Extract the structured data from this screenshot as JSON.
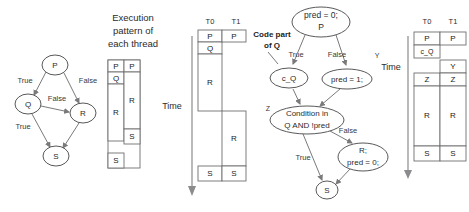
{
  "figure": {
    "colors": {
      "stroke": "#59595b",
      "edge": "#7a7a7c",
      "text": "#2b2b2b",
      "background": "#ffffff"
    }
  },
  "panel_left": {
    "name": "original-control-flow-graph",
    "nodes": [
      {
        "id": "P",
        "label": "P",
        "cx": 55,
        "cy": 65,
        "rx": 13,
        "ry": 10
      },
      {
        "id": "Q",
        "label": "Q",
        "cx": 28,
        "cy": 104,
        "rx": 13,
        "ry": 10
      },
      {
        "id": "R",
        "label": "R",
        "cx": 83,
        "cy": 113,
        "rx": 13,
        "ry": 10
      },
      {
        "id": "S",
        "label": "S",
        "cx": 56,
        "cy": 156,
        "rx": 13,
        "ry": 10
      }
    ],
    "edges": [
      {
        "from": "P",
        "to": "Q",
        "label": "True",
        "lx": 25,
        "ly": 81
      },
      {
        "from": "P",
        "to": "R",
        "label": "False",
        "lx": 88,
        "ly": 81
      },
      {
        "from": "Q",
        "to": "R",
        "label": "False",
        "lx": 57,
        "ly": 99
      },
      {
        "from": "Q",
        "to": "S",
        "label": "True",
        "lx": 23,
        "ly": 127
      },
      {
        "from": "R",
        "to": "S",
        "label": "",
        "lx": 0,
        "ly": 0
      }
    ]
  },
  "caption": {
    "name": "execution-pattern-caption",
    "lines": [
      "Execution",
      "pattern of",
      "each thread"
    ]
  },
  "table_middle": {
    "name": "execution-pattern-table",
    "columns": [
      "T0",
      "T1"
    ],
    "show_headers": false,
    "cells": [
      {
        "col": 0,
        "label": "P",
        "top": 0,
        "height": 12
      },
      {
        "col": 0,
        "label": "Q",
        "top": 12,
        "height": 12
      },
      {
        "col": 0,
        "label": "R",
        "top": 24,
        "height": 57
      },
      {
        "col": 0,
        "label": "S",
        "top": 93,
        "height": 14
      },
      {
        "col": 1,
        "label": "P",
        "top": 0,
        "height": 12
      },
      {
        "col": 1,
        "label": "R",
        "top": 12,
        "height": 57
      },
      {
        "col": 1,
        "label": "S",
        "top": 69,
        "height": 14
      }
    ]
  },
  "timeline_middle": {
    "name": "time-axis-middle",
    "label": "Time"
  },
  "table_middle_right": {
    "name": "interleaved-schedule-table",
    "columns": [
      "T0",
      "T1"
    ],
    "show_headers": true,
    "cells": [
      {
        "col": 0,
        "label": "P",
        "top": 0,
        "height": 12
      },
      {
        "col": 0,
        "label": "Q",
        "top": 12,
        "height": 12
      },
      {
        "col": 0,
        "label": "R",
        "top": 24,
        "height": 57
      },
      {
        "col": 0,
        "label": "S",
        "top": 136,
        "height": 14
      },
      {
        "col": 1,
        "label": "P",
        "top": 0,
        "height": 12
      },
      {
        "col": 1,
        "label": "R",
        "top": 81,
        "height": 55
      },
      {
        "col": 1,
        "label": "S",
        "top": 136,
        "height": 14
      }
    ]
  },
  "panel_right_graph": {
    "name": "predicated-control-flow-graph",
    "annotation": {
      "lines": [
        "Code part",
        "of Q"
      ],
      "x": 272,
      "y": 38
    },
    "nodes": [
      {
        "id": "P",
        "lines": [
          "pred = 0;",
          "P"
        ],
        "cx": 321,
        "cy": 22,
        "rx": 29,
        "ry": 15
      },
      {
        "id": "c_Q",
        "lines": [
          "c_Q"
        ],
        "cx": 289,
        "cy": 78,
        "rx": 19,
        "ry": 10
      },
      {
        "id": "pred1",
        "lines": [
          "pred = 1;"
        ],
        "cx": 347,
        "cy": 79,
        "rx": 25,
        "ry": 10
      },
      {
        "id": "cond",
        "lines": [
          "Condition in",
          "Q  AND !pred"
        ],
        "cx": 307,
        "cy": 120,
        "rx": 36,
        "ry": 14
      },
      {
        "id": "R",
        "lines": [
          "R;",
          "pred = 0;"
        ],
        "cx": 363,
        "cy": 157,
        "rx": 25,
        "ry": 14
      },
      {
        "id": "S",
        "lines": [
          "S"
        ],
        "cx": 327,
        "cy": 190,
        "rx": 11,
        "ry": 9
      }
    ],
    "edge_labels": [
      {
        "text": "True",
        "x": 296,
        "y": 55
      },
      {
        "text": "False",
        "x": 337,
        "y": 55
      },
      {
        "text": "Y",
        "x": 377,
        "y": 56
      },
      {
        "text": "Z",
        "x": 269,
        "y": 109
      },
      {
        "text": "False",
        "x": 345,
        "y": 130
      },
      {
        "text": "True",
        "x": 303,
        "y": 158
      }
    ]
  },
  "timeline_right": {
    "name": "time-axis-right",
    "label": "Time"
  },
  "table_right": {
    "name": "predicated-schedule-table",
    "columns": [
      "T0",
      "T1"
    ],
    "show_headers": true,
    "cells": [
      {
        "col": 0,
        "label": "P",
        "top": 0,
        "height": 13
      },
      {
        "col": 0,
        "label": "c_Q",
        "top": 13,
        "height": 13
      },
      {
        "col": 0,
        "label": "Z",
        "top": 41,
        "height": 13
      },
      {
        "col": 0,
        "label": "R",
        "top": 54,
        "height": 60
      },
      {
        "col": 0,
        "label": "S",
        "top": 114,
        "height": 14
      },
      {
        "col": 1,
        "label": "P",
        "top": 0,
        "height": 13
      },
      {
        "col": 1,
        "label": "Y",
        "top": 28,
        "height": 13
      },
      {
        "col": 1,
        "label": "Z",
        "top": 41,
        "height": 13
      },
      {
        "col": 1,
        "label": "R",
        "top": 54,
        "height": 60
      },
      {
        "col": 1,
        "label": "S",
        "top": 114,
        "height": 14
      }
    ]
  }
}
